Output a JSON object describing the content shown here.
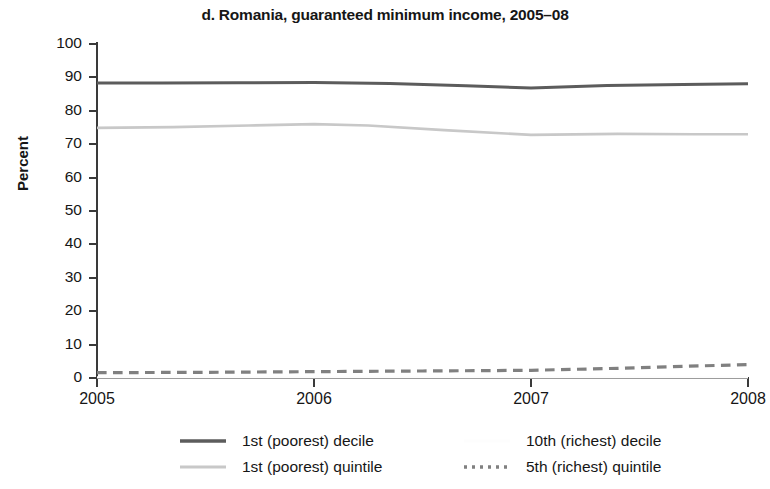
{
  "chart_data": {
    "type": "line",
    "title": "d. Romania, guaranteed minimum income, 2005–08",
    "xlabel": "",
    "ylabel": "Percent",
    "x": [
      2005,
      2006,
      2007,
      2008
    ],
    "xlim": [
      2005,
      2008
    ],
    "ylim": [
      0,
      100
    ],
    "ytick_labels": [
      "0",
      "10",
      "20",
      "30",
      "40",
      "50",
      "60",
      "70",
      "80",
      "90",
      "100"
    ],
    "ytick_values": [
      0,
      10,
      20,
      30,
      40,
      50,
      60,
      70,
      80,
      90,
      100
    ],
    "xtick_labels": [
      "2005",
      "2006",
      "2007",
      "2008"
    ],
    "xtick_values": [
      2005,
      2006,
      2007,
      2008
    ],
    "grid": false,
    "legend_position": "bottom",
    "series": [
      {
        "name": "1st (poorest) decile",
        "style": "solid",
        "color": "#5c5c5c",
        "width": 3.0,
        "values": [
          88.3,
          88.5,
          86.8,
          88.1
        ],
        "points": [
          {
            "x": 2005.0,
            "y": 88.3
          },
          {
            "x": 2005.3,
            "y": 88.3
          },
          {
            "x": 2005.65,
            "y": 88.4
          },
          {
            "x": 2006.0,
            "y": 88.5
          },
          {
            "x": 2006.35,
            "y": 88.2
          },
          {
            "x": 2006.7,
            "y": 87.5
          },
          {
            "x": 2007.0,
            "y": 86.8
          },
          {
            "x": 2007.35,
            "y": 87.6
          },
          {
            "x": 2007.7,
            "y": 87.9
          },
          {
            "x": 2008.0,
            "y": 88.1
          }
        ]
      },
      {
        "name": "1st (poorest) quintile",
        "style": "solid",
        "color": "#c8c8c8",
        "width": 2.6,
        "values": [
          74.9,
          76.0,
          72.8,
          73.0
        ],
        "points": [
          {
            "x": 2005.0,
            "y": 74.9
          },
          {
            "x": 2005.35,
            "y": 75.1
          },
          {
            "x": 2005.7,
            "y": 75.6
          },
          {
            "x": 2006.0,
            "y": 76.0
          },
          {
            "x": 2006.25,
            "y": 75.6
          },
          {
            "x": 2006.6,
            "y": 74.2
          },
          {
            "x": 2007.0,
            "y": 72.8
          },
          {
            "x": 2007.4,
            "y": 73.1
          },
          {
            "x": 2007.75,
            "y": 73.0
          },
          {
            "x": 2008.0,
            "y": 73.0
          }
        ]
      },
      {
        "name": "10th (richest) decile",
        "style": "solid",
        "color": "#fdfdfd",
        "width": 2.4,
        "values": [
          0.2,
          0.2,
          0.2,
          0.2
        ],
        "points": [
          {
            "x": 2005.0,
            "y": 0.2
          },
          {
            "x": 2008.0,
            "y": 0.2
          }
        ]
      },
      {
        "name": "5th (richest) quintile",
        "style": "dashed",
        "color": "#808080",
        "width": 3.2,
        "values": [
          1.6,
          1.9,
          2.3,
          4.0
        ],
        "points": [
          {
            "x": 2005.0,
            "y": 1.6
          },
          {
            "x": 2005.5,
            "y": 1.7
          },
          {
            "x": 2006.0,
            "y": 1.9
          },
          {
            "x": 2006.5,
            "y": 2.1
          },
          {
            "x": 2007.0,
            "y": 2.3
          },
          {
            "x": 2007.4,
            "y": 2.9
          },
          {
            "x": 2007.7,
            "y": 3.5
          },
          {
            "x": 2008.0,
            "y": 4.0
          }
        ]
      }
    ]
  },
  "legend": {
    "entries": [
      {
        "label": "1st (poorest) decile"
      },
      {
        "label": "10th (richest) decile"
      },
      {
        "label": "1st (poorest) quintile"
      },
      {
        "label": "5th (richest) quintile"
      }
    ]
  },
  "colors": {
    "axis": "#3a3a3a",
    "text": "#161616",
    "background": "#ffffff"
  }
}
